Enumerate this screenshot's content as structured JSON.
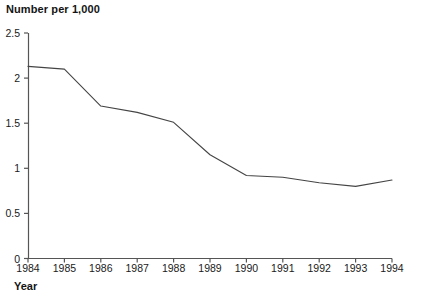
{
  "chart_data": {
    "type": "line",
    "title": "Number per 1,000",
    "xlabel": "Year",
    "ylabel": "",
    "categories": [
      "1984",
      "1985",
      "1986",
      "1987",
      "1988",
      "1989",
      "1990",
      "1991",
      "1992",
      "1993",
      "1994"
    ],
    "x": [
      1984,
      1985,
      1986,
      1987,
      1988,
      1989,
      1990,
      1991,
      1992,
      1993,
      1994
    ],
    "values": [
      2.13,
      2.1,
      1.69,
      1.62,
      1.51,
      1.15,
      0.92,
      0.9,
      0.84,
      0.8,
      0.87
    ],
    "series": [
      {
        "name": "Number per 1,000",
        "values": [
          2.13,
          2.1,
          1.69,
          1.62,
          1.51,
          1.15,
          0.92,
          0.9,
          0.84,
          0.8,
          0.87
        ]
      }
    ],
    "ylim": [
      0,
      2.5
    ],
    "xlim": [
      1984,
      1994
    ],
    "yticks": [
      "0",
      "0.5",
      "1",
      "1.5",
      "2",
      "2.5"
    ],
    "ytick_values": [
      0,
      0.5,
      1,
      1.5,
      2,
      2.5
    ],
    "xticks": [
      "1984",
      "1985",
      "1986",
      "1987",
      "1988",
      "1989",
      "1990",
      "1991",
      "1992",
      "1993",
      "1994"
    ],
    "grid": false,
    "legend": false,
    "legend_position": "none",
    "markers": false,
    "line_color": "#444444",
    "axis_color": "#555555",
    "text_color": "#141414",
    "background_color": "#ffffff"
  }
}
